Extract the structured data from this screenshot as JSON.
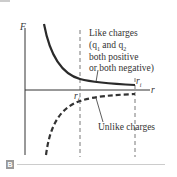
{
  "figure": {
    "panel_label": "B",
    "axis": {
      "y_label": "F",
      "x_label": "r",
      "r_i_label": "r",
      "r_i_sub": "i",
      "r_f_label": "r",
      "r_f_sub": "f"
    },
    "curves": {
      "like": {
        "line1": "Like charges",
        "line2_pre": "(q",
        "line2_sub1": "1",
        "line2_mid": " and q",
        "line2_sub2": "2",
        "line3": "both positive",
        "line4": "or both negative)",
        "style": "solid",
        "color": "#2a2a2a"
      },
      "unlike": {
        "label": "Unlike charges",
        "style": "dashed",
        "color": "#333333"
      }
    }
  }
}
